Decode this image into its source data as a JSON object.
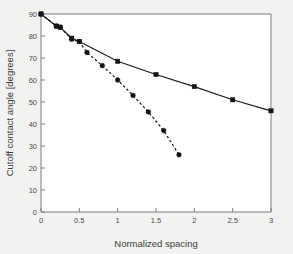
{
  "chart_data": {
    "type": "line",
    "title": "",
    "xlabel": "Normalized spacing",
    "ylabel": "Cutoff contact angle [degrees]",
    "xlim": [
      0,
      3
    ],
    "ylim": [
      0,
      90
    ],
    "xticks": [
      0,
      0.5,
      1,
      1.5,
      2,
      2.5,
      3
    ],
    "xticklabels": [
      "0",
      "0.5",
      "1",
      "1.5",
      "2",
      "2.5",
      "3"
    ],
    "yticks": [
      0,
      10,
      20,
      30,
      40,
      50,
      60,
      70,
      80,
      90
    ],
    "yticklabels": [
      "0",
      "10",
      "20",
      "30",
      "40",
      "50",
      "60",
      "70",
      "80",
      "90"
    ],
    "grid": false,
    "legend": "none",
    "series": [
      {
        "name": "solid-curve",
        "linestyle": "solid",
        "marker": "square",
        "color": "#151515",
        "x": [
          0,
          0.2,
          0.25,
          0.4,
          0.5,
          1.0,
          1.5,
          2.0,
          2.5,
          3.0
        ],
        "y": [
          90,
          84.5,
          84,
          79,
          77.5,
          68.5,
          62.5,
          57,
          51,
          46
        ]
      },
      {
        "name": "dashed-curve",
        "linestyle": "dashed",
        "marker": "circle",
        "color": "#151515",
        "x": [
          0,
          0.2,
          0.25,
          0.4,
          0.5,
          0.6,
          0.8,
          1.0,
          1.2,
          1.4,
          1.6,
          1.8
        ],
        "y": [
          90,
          84.5,
          84,
          78.5,
          77.5,
          72.5,
          66.5,
          60,
          53,
          45.5,
          37,
          26
        ]
      }
    ]
  },
  "axes": {
    "tick_color": "#7d7d7d",
    "text_color": "#4a4a4a",
    "background": "#f2f2f0",
    "plot_background": "#ffffff"
  }
}
